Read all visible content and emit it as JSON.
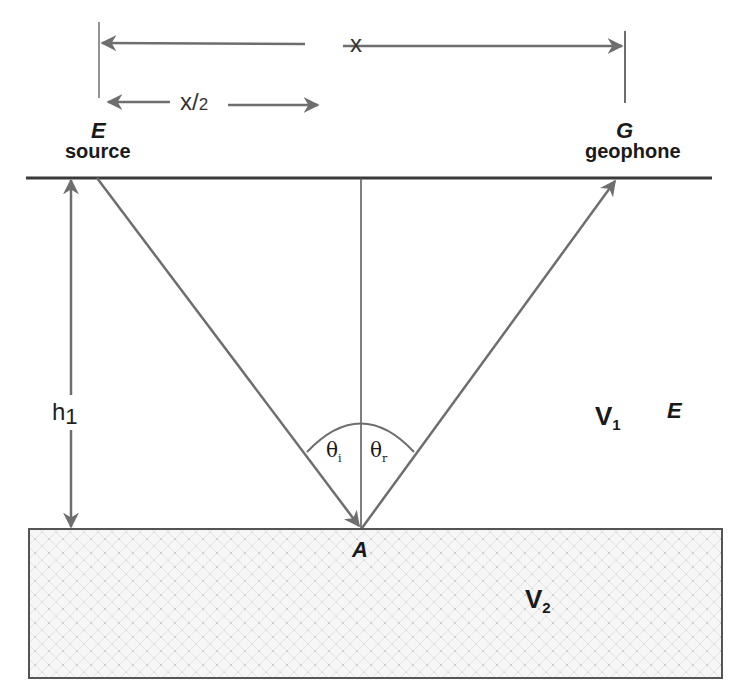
{
  "diagram": {
    "type": "seismic reflection geometry",
    "labels": {
      "offset": "x",
      "half_offset_main": "x/",
      "half_offset_sub": "2",
      "source_letter": "E",
      "source_word": "source",
      "receiver_letter": "G",
      "receiver_word": "geophone",
      "depth_main": "h",
      "depth_sub": "1",
      "upper_velocity_main": "V",
      "upper_velocity_sub": "1",
      "upper_extra": "E",
      "lower_velocity_main": "V",
      "lower_velocity_sub": "2",
      "reflection_point": "A",
      "incidence_angle_main": "θ",
      "incidence_angle_sub": "i",
      "reflection_angle_main": "θ",
      "reflection_angle_sub": "r"
    },
    "colors": {
      "line": "#6e6e6e",
      "surface": "#3a3a3a",
      "text": "#1a1a1a",
      "layer_fill": "#f4f4f4",
      "layer_dots": "#c8c8c8"
    }
  }
}
